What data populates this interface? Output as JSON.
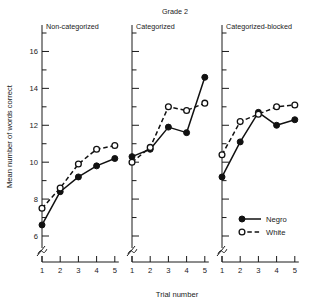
{
  "chart_data": {
    "type": "line",
    "title": "Grade 2",
    "xlabel": "Trial number",
    "ylabel": "Mean number of words correct",
    "x": [
      1,
      2,
      3,
      4,
      5
    ],
    "xticklabels": [
      "1",
      "2",
      "3",
      "4",
      "5"
    ],
    "ylim": [
      6,
      17
    ],
    "yticks": [
      6,
      8,
      10,
      12,
      14,
      16
    ],
    "yticklabels": [
      "6",
      "8",
      "10",
      "12",
      "14",
      "16"
    ],
    "yminorticks": [
      7,
      9,
      11,
      13,
      15,
      17
    ],
    "grid": false,
    "axis_break": true,
    "legend_position": "panel-3-lower-left",
    "legend": [
      {
        "name": "Negro",
        "marker": "filled-circle",
        "line": "solid"
      },
      {
        "name": "White",
        "marker": "open-circle",
        "line": "dashed"
      }
    ],
    "panels": [
      {
        "label": "Non-categorized",
        "series": [
          {
            "name": "Negro",
            "marker": "filled-circle",
            "line": "solid",
            "values": [
              6.6,
              8.4,
              9.2,
              9.8,
              10.2
            ]
          },
          {
            "name": "White",
            "marker": "open-circle",
            "line": "dashed",
            "values": [
              7.5,
              8.6,
              9.9,
              10.7,
              10.9
            ]
          }
        ]
      },
      {
        "label": "Categorized",
        "series": [
          {
            "name": "Negro",
            "marker": "filled-circle",
            "line": "solid",
            "values": [
              10.3,
              10.7,
              11.9,
              11.6,
              14.6
            ]
          },
          {
            "name": "White",
            "marker": "open-circle",
            "line": "dashed",
            "values": [
              10.0,
              10.8,
              13.0,
              12.8,
              13.2
            ]
          }
        ]
      },
      {
        "label": "Categorized-blocked",
        "series": [
          {
            "name": "Negro",
            "marker": "filled-circle",
            "line": "solid",
            "values": [
              9.2,
              11.1,
              12.7,
              12.0,
              12.3
            ]
          },
          {
            "name": "White",
            "marker": "open-circle",
            "line": "dashed",
            "values": [
              10.4,
              12.2,
              12.6,
              13.0,
              13.1
            ]
          }
        ]
      }
    ]
  }
}
